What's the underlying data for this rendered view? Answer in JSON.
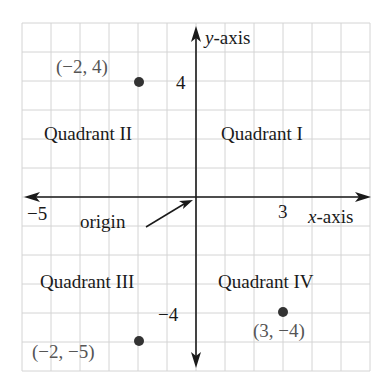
{
  "diagram": {
    "title": "",
    "grid": {
      "min": -6,
      "max": 6,
      "step": 1,
      "cell_px": 29,
      "origin_px": [
        196,
        197
      ],
      "grid_color": "#d4d4d4"
    },
    "axes": {
      "x_axis_label_var": "x",
      "x_axis_label_suffix": "-axis",
      "y_axis_label_var": "y",
      "y_axis_label_suffix": "-axis"
    },
    "ticks": {
      "x_neg": "−5",
      "x_pos": "3",
      "y_pos": "4",
      "y_neg": "−4"
    },
    "quadrants": {
      "q1": "Quadrant I",
      "q2": "Quadrant II",
      "q3": "Quadrant III",
      "q4": "Quadrant IV"
    },
    "origin_label": "origin",
    "points": [
      {
        "x": -2,
        "y": 4,
        "label": "(−2, 4)"
      },
      {
        "x": -2,
        "y": -5,
        "label": "(−2, −5)"
      },
      {
        "x": 3,
        "y": -4,
        "label": "(3, −4)"
      }
    ],
    "colors": {
      "axis": "#1a1a1a",
      "point": "#333333",
      "point_label": "#555555"
    }
  },
  "chart_data": {
    "type": "scatter",
    "title": "",
    "xlabel": "x-axis",
    "ylabel": "y-axis",
    "xlim": [
      -6,
      6
    ],
    "ylim": [
      -6,
      6
    ],
    "grid": true,
    "x": [
      -2,
      -2,
      3
    ],
    "y": [
      4,
      -5,
      -4
    ],
    "point_labels": [
      "(−2, 4)",
      "(−2, −5)",
      "(3, −4)"
    ],
    "tick_labels": {
      "x": [
        "−5",
        "3"
      ],
      "y": [
        "4",
        "−4"
      ]
    },
    "annotations": [
      "Quadrant I",
      "Quadrant II",
      "Quadrant III",
      "Quadrant IV",
      "origin"
    ]
  }
}
